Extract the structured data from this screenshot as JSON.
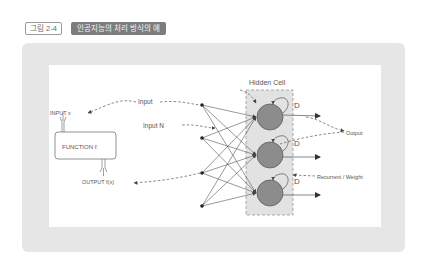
{
  "header": {
    "figure_number": "그림 2-4",
    "figure_title": "인공지능의 처리 방식의 예"
  },
  "diagram": {
    "labels": {
      "input_x": "INPUT x",
      "function": "FUNCTION f:",
      "output_fx": "OUTPUT f(x)",
      "input": "Input",
      "input_n": "Input N",
      "hidden_cell": "Hidden Cell",
      "output": "Output",
      "recurrent_weight": "Recurrent / Weight",
      "delay_1": "D",
      "delay_2": "D",
      "delay_3": "D"
    },
    "input_nodes": 4,
    "hidden_nodes": 3,
    "colors": {
      "panel_bg": "#e6e6e6",
      "hidden_box_bg": "#e2e2e2",
      "hidden_node_fill": "#8c8c8c",
      "line": "#555555",
      "tag_dark": "#7d7d7d"
    }
  }
}
